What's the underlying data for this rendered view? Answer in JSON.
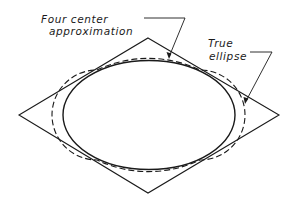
{
  "diagram": {
    "labels": {
      "four_center_line1": "Four center",
      "four_center_line2": "approximation",
      "true_line1": "True",
      "true_line2": "ellipse"
    },
    "colors": {
      "stroke": "#1a1a1a",
      "background": "#ffffff"
    },
    "rhombus": {
      "top": [
        148,
        38
      ],
      "right": [
        279,
        115
      ],
      "bottom": [
        148,
        193
      ],
      "left": [
        19,
        115
      ]
    },
    "true_ellipse": {
      "cx": 149,
      "cy": 115,
      "rx": 87,
      "ry": 54
    },
    "four_center": {
      "cx": 149,
      "cy": 115,
      "rx": 89,
      "ry": 55
    }
  }
}
